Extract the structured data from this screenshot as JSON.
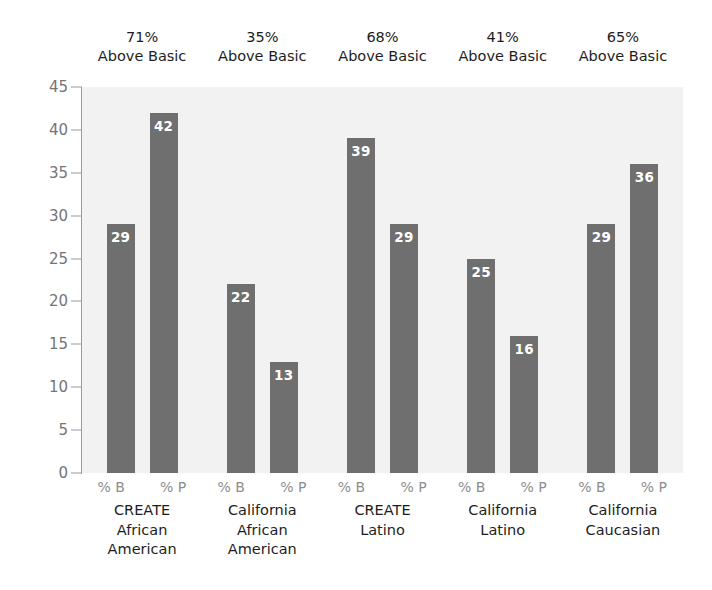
{
  "chart_data": {
    "type": "bar",
    "title": "",
    "xlabel": "",
    "ylabel": "",
    "ylim": [
      0,
      45
    ],
    "yticks": [
      45,
      40,
      35,
      30,
      25,
      20,
      15,
      10,
      5,
      0
    ],
    "grid": false,
    "legend": "none",
    "bar_color": "#6f6f6f",
    "plot_background": "#f2f2f2",
    "series_labels": [
      "% B",
      "% P"
    ],
    "categories": [
      {
        "lines": [
          "CREATE",
          "African",
          "American"
        ],
        "above_basic": "71%",
        "above_basic_label": "Above Basic",
        "pct_b": 29,
        "pct_p": 42
      },
      {
        "lines": [
          "California",
          "African",
          "American"
        ],
        "above_basic": "35%",
        "above_basic_label": "Above Basic",
        "pct_b": 22,
        "pct_p": 13
      },
      {
        "lines": [
          "CREATE",
          "Latino"
        ],
        "above_basic": "68%",
        "above_basic_label": "Above Basic",
        "pct_b": 39,
        "pct_p": 29
      },
      {
        "lines": [
          "California",
          "Latino"
        ],
        "above_basic": "41%",
        "above_basic_label": "Above Basic",
        "pct_b": 25,
        "pct_p": 16
      },
      {
        "lines": [
          "California",
          "Caucasian"
        ],
        "above_basic": "65%",
        "above_basic_label": "Above Basic",
        "pct_b": 29,
        "pct_p": 36
      }
    ],
    "series": [
      {
        "name": "% B",
        "values": [
          29,
          22,
          39,
          25,
          29
        ]
      },
      {
        "name": "% P",
        "values": [
          42,
          13,
          29,
          16,
          36
        ]
      }
    ]
  }
}
